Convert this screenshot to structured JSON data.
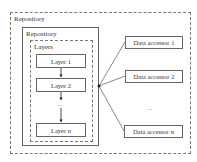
{
  "outer": {
    "label": "Repository"
  },
  "inner": {
    "label": "Repository"
  },
  "layers": {
    "label": "Layers",
    "items": [
      "Layer 1",
      "Layer 2",
      "Layer n"
    ],
    "ellipsis": "..."
  },
  "accessors": {
    "items": [
      "Data accessor 1",
      "Data accessor 2",
      "Data accessor n"
    ],
    "ellipsis": "..."
  }
}
